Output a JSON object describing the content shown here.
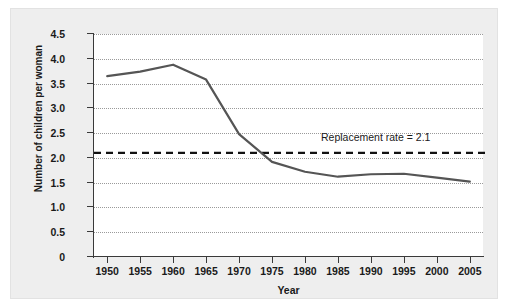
{
  "chart_data": {
    "type": "line",
    "title": "",
    "xlabel": "Year",
    "ylabel": "Number of children per woman",
    "xlim": [
      1948,
      2007
    ],
    "ylim": [
      0,
      4.5
    ],
    "grid": true,
    "legend": "none",
    "x": [
      1950,
      1955,
      1960,
      1965,
      1970,
      1975,
      1980,
      1985,
      1990,
      1995,
      2000,
      2005
    ],
    "xticklabels": [
      "1950",
      "1955",
      "1960",
      "1965",
      "1970",
      "1975",
      "1980",
      "1985",
      "1990",
      "1995",
      "2000",
      "2005"
    ],
    "yticks": [
      0,
      0.5,
      1.0,
      1.5,
      2.0,
      2.5,
      3.0,
      3.5,
      4.0,
      4.5
    ],
    "yticklabels": [
      "0",
      "0.5",
      "1.0",
      "1.5",
      "2.0",
      "2.5",
      "3.0",
      "3.5",
      "4.0",
      "4.5"
    ],
    "series": [
      {
        "name": "Total fertility rate",
        "color": "#555555",
        "values": [
          3.65,
          3.74,
          3.88,
          3.58,
          2.48,
          1.92,
          1.72,
          1.62,
          1.67,
          1.68,
          1.6,
          1.52
        ]
      }
    ],
    "reference_lines": [
      {
        "name": "replacement-rate",
        "value": 2.1,
        "style": "dashed",
        "color": "#111111",
        "label": "Replacement rate = 2.1"
      }
    ]
  },
  "annotation": {
    "replacement_label": "Replacement rate = 2.1"
  },
  "axes": {
    "x_title": "Year",
    "y_title": "Number of children per woman"
  }
}
